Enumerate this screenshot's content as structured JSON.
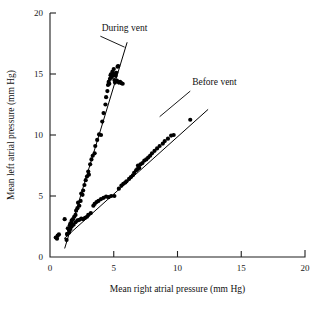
{
  "chart_data": {
    "type": "scatter",
    "title": "",
    "xlabel": "Mean right atrial pressure (mm Hg)",
    "ylabel": "Mean left atrial pressure (mm Hg)",
    "xlim": [
      0,
      20
    ],
    "ylim": [
      0,
      20
    ],
    "xticks": [
      0,
      5,
      10,
      15,
      20
    ],
    "yticks": [
      0,
      5,
      10,
      15,
      20
    ],
    "xticklabels": [
      "0",
      "5",
      "10",
      "15",
      "20"
    ],
    "yticklabels": [
      "0",
      "5",
      "10",
      "15",
      "20"
    ],
    "grid": false,
    "legend_position": "inline-annotations",
    "point_color": "#000000",
    "line_color": "#000000",
    "axis_color": "#1f1f1f",
    "series": [
      {
        "name": "During vent",
        "label": "During vent",
        "fit_line": {
          "x": [
            1.15,
            6.05
          ],
          "y": [
            0.7,
            17.6
          ]
        },
        "points": [
          [
            0.45,
            1.6
          ],
          [
            0.55,
            1.5
          ],
          [
            0.6,
            1.75
          ],
          [
            0.7,
            1.85
          ],
          [
            1.15,
            3.1
          ],
          [
            1.3,
            1.4
          ],
          [
            1.35,
            1.9
          ],
          [
            1.4,
            2.35
          ],
          [
            1.5,
            2.2
          ],
          [
            1.55,
            2.6
          ],
          [
            1.6,
            2.75
          ],
          [
            1.7,
            3.0
          ],
          [
            1.8,
            3.1
          ],
          [
            1.9,
            3.3
          ],
          [
            2.0,
            3.45
          ],
          [
            2.05,
            3.8
          ],
          [
            2.15,
            4.0
          ],
          [
            2.2,
            4.45
          ],
          [
            2.3,
            4.2
          ],
          [
            2.4,
            4.6
          ],
          [
            2.45,
            5.2
          ],
          [
            2.55,
            5.1
          ],
          [
            2.6,
            5.45
          ],
          [
            2.7,
            5.9
          ],
          [
            2.8,
            6.3
          ],
          [
            2.9,
            6.6
          ],
          [
            3.0,
            7.0
          ],
          [
            3.05,
            6.75
          ],
          [
            3.15,
            7.6
          ],
          [
            3.25,
            8.0
          ],
          [
            3.35,
            8.3
          ],
          [
            3.5,
            8.5
          ],
          [
            3.55,
            9.1
          ],
          [
            3.7,
            9.6
          ],
          [
            3.85,
            10.05
          ],
          [
            4.0,
            10.0
          ],
          [
            4.1,
            11.1
          ],
          [
            4.2,
            11.8
          ],
          [
            4.35,
            12.5
          ],
          [
            4.4,
            13.1
          ],
          [
            4.5,
            13.6
          ],
          [
            4.55,
            14.1
          ],
          [
            4.6,
            14.35
          ],
          [
            4.65,
            14.2
          ],
          [
            4.7,
            14.6
          ],
          [
            4.75,
            14.9
          ],
          [
            4.8,
            15.0
          ],
          [
            4.85,
            14.75
          ],
          [
            4.9,
            15.2
          ],
          [
            4.95,
            15.05
          ],
          [
            5.0,
            14.9
          ],
          [
            5.0,
            15.4
          ],
          [
            5.05,
            14.5
          ],
          [
            5.1,
            14.3
          ],
          [
            5.15,
            14.85
          ],
          [
            5.2,
            15.1
          ],
          [
            5.25,
            14.45
          ],
          [
            5.3,
            15.6
          ],
          [
            5.35,
            15.65
          ],
          [
            5.4,
            14.3
          ],
          [
            5.5,
            14.35
          ],
          [
            5.6,
            14.25
          ],
          [
            5.7,
            14.2
          ]
        ]
      },
      {
        "name": "Before vent",
        "label": "Before vent",
        "fit_line": {
          "x": [
            1.1,
            12.4
          ],
          "y": [
            1.5,
            12.1
          ]
        },
        "points": [
          [
            1.35,
            1.85
          ],
          [
            1.5,
            2.0
          ],
          [
            1.6,
            2.3
          ],
          [
            1.7,
            2.5
          ],
          [
            1.85,
            2.65
          ],
          [
            2.0,
            2.85
          ],
          [
            2.15,
            3.0
          ],
          [
            2.3,
            3.05
          ],
          [
            2.45,
            3.15
          ],
          [
            2.6,
            3.1
          ],
          [
            2.75,
            3.2
          ],
          [
            2.9,
            3.3
          ],
          [
            3.0,
            3.45
          ],
          [
            3.2,
            3.6
          ],
          [
            3.4,
            4.2
          ],
          [
            3.5,
            4.35
          ],
          [
            3.65,
            4.5
          ],
          [
            3.8,
            4.6
          ],
          [
            4.0,
            4.75
          ],
          [
            4.2,
            4.85
          ],
          [
            4.4,
            4.95
          ],
          [
            4.6,
            4.9
          ],
          [
            4.8,
            5.0
          ],
          [
            5.05,
            5.0
          ],
          [
            5.4,
            5.6
          ],
          [
            5.6,
            5.85
          ],
          [
            5.75,
            6.0
          ],
          [
            5.9,
            6.1
          ],
          [
            6.0,
            6.2
          ],
          [
            6.2,
            6.4
          ],
          [
            6.35,
            6.55
          ],
          [
            6.5,
            6.7
          ],
          [
            6.6,
            6.9
          ],
          [
            6.75,
            7.1
          ],
          [
            6.85,
            7.2
          ],
          [
            6.9,
            7.5
          ],
          [
            7.0,
            7.3
          ],
          [
            7.1,
            7.6
          ],
          [
            7.25,
            7.7
          ],
          [
            7.4,
            7.9
          ],
          [
            7.55,
            8.0
          ],
          [
            7.7,
            8.15
          ],
          [
            7.85,
            8.3
          ],
          [
            8.0,
            8.5
          ],
          [
            8.2,
            8.7
          ],
          [
            8.4,
            8.9
          ],
          [
            8.6,
            9.1
          ],
          [
            8.85,
            9.3
          ],
          [
            9.0,
            9.5
          ],
          [
            9.25,
            9.7
          ],
          [
            9.5,
            9.95
          ],
          [
            9.7,
            10.0
          ],
          [
            11.0,
            11.25
          ]
        ]
      }
    ],
    "annotations": [
      {
        "text": "During vent",
        "text_x": 4.05,
        "text_y": 18.55,
        "leader": {
          "x1": 3.95,
          "y1": 18.1,
          "x2": 5.85,
          "y2": 17.2
        }
      },
      {
        "text": "Before vent",
        "text_x": 11.15,
        "text_y": 14.1,
        "leader": {
          "x1": 11.0,
          "y1": 13.6,
          "x2": 8.6,
          "y2": 11.5
        }
      }
    ]
  }
}
